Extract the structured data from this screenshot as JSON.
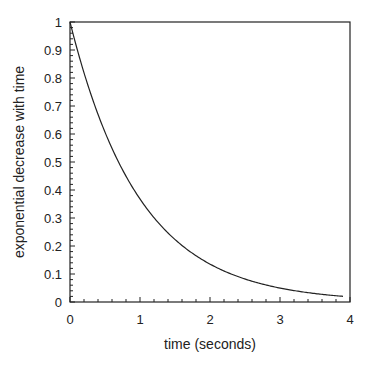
{
  "chart_data": {
    "type": "line",
    "title": "",
    "xlabel": "time (seconds)",
    "ylabel": "exponential decrease with time",
    "xlim": [
      0,
      4
    ],
    "ylim": [
      0,
      1
    ],
    "xticks": [
      "0",
      "1",
      "2",
      "3",
      "4"
    ],
    "yticks": [
      "0",
      "0.1",
      "0.2",
      "0.3",
      "0.4",
      "0.5",
      "0.6",
      "0.7",
      "0.8",
      "0.9",
      "1"
    ],
    "grid": false,
    "series": [
      {
        "name": "exp(-t)",
        "x": [
          0,
          0.5,
          1,
          1.5,
          2,
          2.5,
          3,
          3.5,
          3.9
        ],
        "values": [
          1,
          0.607,
          0.368,
          0.223,
          0.135,
          0.082,
          0.05,
          0.03,
          0.02
        ]
      }
    ]
  }
}
